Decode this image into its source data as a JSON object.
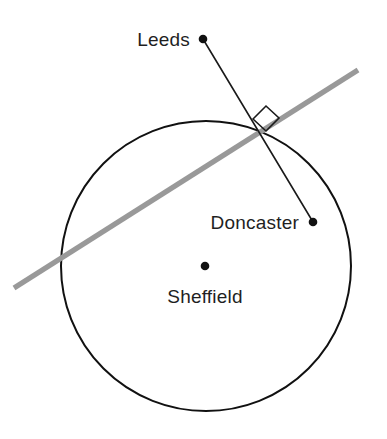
{
  "diagram": {
    "type": "geometry-construction",
    "canvas": {
      "width": 387,
      "height": 439,
      "background": "#ffffff"
    },
    "colors": {
      "circle_stroke": "#111111",
      "tangent_line": "#999999",
      "radius_line": "#1a1a1a",
      "point_fill": "#111111",
      "label_text": "#1f1f1f",
      "right_angle_stroke": "#1a1a1a"
    },
    "circle": {
      "name": "sheffield-circle",
      "center_x": 206,
      "center_y": 266,
      "radius": 145,
      "stroke_width": 2.0
    },
    "tangent_line": {
      "name": "tangent-line",
      "x1": 14,
      "y1": 288,
      "x2": 358,
      "y2": 70,
      "stroke_width": 5.2
    },
    "radius_line": {
      "name": "leeds-doncaster-line",
      "x1": 203,
      "y1": 39,
      "x2": 313,
      "y2": 222,
      "stroke_width": 1.6
    },
    "right_angle_marker": {
      "name": "right-angle-marker",
      "points": "253,119 266,106 279,118 266,131",
      "stroke_width": 1.6,
      "size": 13
    },
    "points": [
      {
        "id": "leeds",
        "label": "Leeds",
        "cx": 203,
        "cy": 39,
        "r": 4.3,
        "label_x": 190,
        "label_y": 46,
        "label_anchor": "end"
      },
      {
        "id": "doncaster",
        "label": "Doncaster",
        "cx": 313,
        "cy": 222,
        "r": 4.3,
        "label_x": 299,
        "label_y": 229,
        "label_anchor": "end"
      },
      {
        "id": "sheffield",
        "label": "Sheffield",
        "cx": 205,
        "cy": 266,
        "r": 4.3,
        "label_x": 205,
        "label_y": 303,
        "label_anchor": "middle"
      }
    ]
  }
}
